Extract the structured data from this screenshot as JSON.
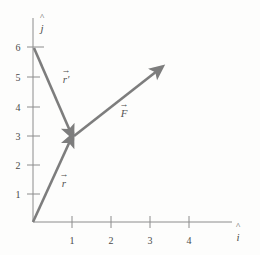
{
  "figure": {
    "kind": "vector-diagram",
    "background_color": "#fdfdfc",
    "axis_color": "#8c8c8c",
    "vector_color": "#7d7d7d",
    "text_color": "#4a4a4a"
  },
  "axes": {
    "x_axis": {
      "name": "horizontal-axis",
      "unit_vector_label": "i",
      "unit_vector_hat": "^",
      "ticks": [
        "1",
        "2",
        "3",
        "4"
      ],
      "tick_values": [
        1,
        2,
        3,
        4
      ],
      "range": [
        0,
        4.6
      ]
    },
    "y_axis": {
      "name": "vertical-axis",
      "unit_vector_label": "j",
      "unit_vector_hat": "^",
      "ticks": [
        "1",
        "2",
        "3",
        "4",
        "5",
        "6"
      ],
      "tick_values": [
        1,
        2,
        3,
        4,
        5,
        6
      ],
      "range": [
        0,
        6.9
      ]
    }
  },
  "vectors": [
    {
      "id": "r",
      "label": "r",
      "arrow_accent": "→",
      "start": [
        0,
        0
      ],
      "end": [
        1,
        3
      ],
      "label_position": [
        0.52,
        1.35
      ],
      "description": "position vector r from origin to point (1,3)"
    },
    {
      "id": "r-prime",
      "label": "r′",
      "arrow_accent": "→",
      "start": [
        0,
        6
      ],
      "end": [
        1,
        3
      ],
      "label_position": [
        0.57,
        4.65
      ],
      "description": "vector r-prime from (0,6) to point (1,3)"
    },
    {
      "id": "F",
      "label": "F",
      "arrow_accent": "→",
      "start": [
        1,
        3
      ],
      "end": [
        3.2,
        5.25
      ],
      "label_position": [
        2.1,
        3.85
      ],
      "description": "force vector F applied at point (1,3) pointing up and to the right"
    }
  ]
}
